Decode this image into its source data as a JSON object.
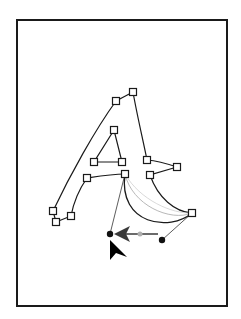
{
  "canvas": {
    "width": 241,
    "height": 319,
    "background": "#ffffff",
    "page_frame": {
      "x": 16,
      "y": 19,
      "width": 212,
      "height": 288,
      "stroke": "#1a1a1a"
    }
  },
  "glyph": {
    "letter": "A",
    "stroke": "#1a1a1a",
    "anchor_size": 7,
    "anchors": [
      {
        "id": "a1",
        "x": 53,
        "y": 211
      },
      {
        "id": "a2",
        "x": 56,
        "y": 222
      },
      {
        "id": "a3",
        "x": 71,
        "y": 216
      },
      {
        "id": "a4",
        "x": 116,
        "y": 101
      },
      {
        "id": "a5",
        "x": 133,
        "y": 92
      },
      {
        "id": "a6",
        "x": 114,
        "y": 130
      },
      {
        "id": "a7",
        "x": 94,
        "y": 162
      },
      {
        "id": "a8",
        "x": 122,
        "y": 162
      },
      {
        "id": "a9",
        "x": 87,
        "y": 178
      },
      {
        "id": "a10",
        "x": 125,
        "y": 174
      },
      {
        "id": "a11",
        "x": 147,
        "y": 160
      },
      {
        "id": "a12",
        "x": 177,
        "y": 167
      },
      {
        "id": "a13",
        "x": 150,
        "y": 175
      },
      {
        "id": "a14",
        "x": 192,
        "y": 213
      }
    ]
  },
  "bezier_edit": {
    "handle_points": [
      {
        "id": "h1",
        "x": 110,
        "y": 234
      },
      {
        "id": "h2",
        "x": 162,
        "y": 240
      }
    ],
    "handle_color": "#111111",
    "ghost_curve_color": "#b8b8b8",
    "drag_arrow": {
      "from_x": 158,
      "from_y": 234,
      "to_x": 116,
      "to_y": 234,
      "color": "#3a3a3a"
    }
  },
  "cursor": {
    "type": "direct-selection-arrow",
    "tip_x": 110,
    "tip_y": 240,
    "color": "#000000"
  }
}
